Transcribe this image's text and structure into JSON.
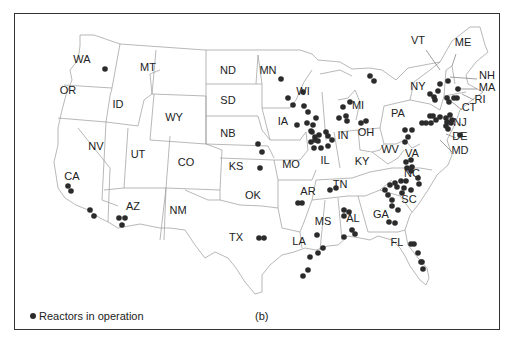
{
  "map": {
    "panel_label": "(b)",
    "legend": {
      "label": "Reactors in operation",
      "marker": "filled-circle",
      "color": "#2b2b2b"
    },
    "states": [
      {
        "code": "WA",
        "x": 82,
        "y": 63
      },
      {
        "code": "OR",
        "x": 68,
        "y": 94
      },
      {
        "code": "ID",
        "x": 118,
        "y": 108
      },
      {
        "code": "MT",
        "x": 148,
        "y": 71
      },
      {
        "code": "WY",
        "x": 174,
        "y": 121
      },
      {
        "code": "ND",
        "x": 228,
        "y": 74
      },
      {
        "code": "SD",
        "x": 228,
        "y": 104
      },
      {
        "code": "NB",
        "x": 228,
        "y": 137
      },
      {
        "code": "KS",
        "x": 236,
        "y": 170
      },
      {
        "code": "NV",
        "x": 96,
        "y": 150
      },
      {
        "code": "UT",
        "x": 138,
        "y": 158
      },
      {
        "code": "CO",
        "x": 186,
        "y": 166
      },
      {
        "code": "CA",
        "x": 72,
        "y": 180
      },
      {
        "code": "AZ",
        "x": 133,
        "y": 210
      },
      {
        "code": "NM",
        "x": 178,
        "y": 214
      },
      {
        "code": "OK",
        "x": 253,
        "y": 199
      },
      {
        "code": "TX",
        "x": 236,
        "y": 241
      },
      {
        "code": "MN",
        "x": 268,
        "y": 74
      },
      {
        "code": "IA",
        "x": 283,
        "y": 125
      },
      {
        "code": "MO",
        "x": 291,
        "y": 168
      },
      {
        "code": "AR",
        "x": 308,
        "y": 195
      },
      {
        "code": "LA",
        "x": 299,
        "y": 245
      },
      {
        "code": "WI",
        "x": 303,
        "y": 95
      },
      {
        "code": "IL",
        "x": 325,
        "y": 164
      },
      {
        "code": "IN",
        "x": 343,
        "y": 139
      },
      {
        "code": "MI",
        "x": 358,
        "y": 109
      },
      {
        "code": "OH",
        "x": 366,
        "y": 136
      },
      {
        "code": "KY",
        "x": 362,
        "y": 165
      },
      {
        "code": "TN",
        "x": 340,
        "y": 188
      },
      {
        "code": "MS",
        "x": 323,
        "y": 225
      },
      {
        "code": "AL",
        "x": 353,
        "y": 222
      },
      {
        "code": "GA",
        "x": 381,
        "y": 218
      },
      {
        "code": "FL",
        "x": 397,
        "y": 246
      },
      {
        "code": "SC",
        "x": 409,
        "y": 203
      },
      {
        "code": "NC",
        "x": 412,
        "y": 177
      },
      {
        "code": "WV",
        "x": 390,
        "y": 153
      },
      {
        "code": "VA",
        "x": 412,
        "y": 157
      },
      {
        "code": "PA",
        "x": 398,
        "y": 117
      },
      {
        "code": "NY",
        "x": 418,
        "y": 90
      },
      {
        "code": "VT",
        "x": 418,
        "y": 44
      },
      {
        "code": "ME",
        "x": 463,
        "y": 46
      },
      {
        "code": "NH",
        "x": 487,
        "y": 79
      },
      {
        "code": "MA",
        "x": 487,
        "y": 91
      },
      {
        "code": "RI",
        "x": 480,
        "y": 103
      },
      {
        "code": "CT",
        "x": 469,
        "y": 111
      },
      {
        "code": "NJ",
        "x": 460,
        "y": 126
      },
      {
        "code": "DE",
        "x": 460,
        "y": 140
      },
      {
        "code": "MD",
        "x": 460,
        "y": 154
      }
    ],
    "reactors_approx_px": [
      [
        105,
        69
      ],
      [
        68,
        186
      ],
      [
        71,
        191
      ],
      [
        90,
        210
      ],
      [
        94,
        216
      ],
      [
        119,
        218
      ],
      [
        125,
        218
      ],
      [
        122,
        225
      ],
      [
        259,
        238
      ],
      [
        264,
        238
      ],
      [
        258,
        144
      ],
      [
        262,
        152
      ],
      [
        260,
        168
      ],
      [
        281,
        79
      ],
      [
        288,
        98
      ],
      [
        293,
        105
      ],
      [
        297,
        125
      ],
      [
        303,
        92
      ],
      [
        304,
        106
      ],
      [
        308,
        112
      ],
      [
        307,
        123
      ],
      [
        311,
        131
      ],
      [
        315,
        137
      ],
      [
        316,
        118
      ],
      [
        313,
        125
      ],
      [
        312,
        132
      ],
      [
        315,
        140
      ],
      [
        311,
        142
      ],
      [
        314,
        148
      ],
      [
        318,
        141
      ],
      [
        319,
        135
      ],
      [
        326,
        132
      ],
      [
        328,
        136
      ],
      [
        321,
        148
      ],
      [
        328,
        146
      ],
      [
        332,
        140
      ],
      [
        302,
        203
      ],
      [
        298,
        203
      ],
      [
        330,
        190
      ],
      [
        336,
        188
      ],
      [
        344,
        210
      ],
      [
        349,
        212
      ],
      [
        344,
        216
      ],
      [
        352,
        230
      ],
      [
        355,
        234
      ],
      [
        344,
        237
      ],
      [
        317,
        235
      ],
      [
        323,
        248
      ],
      [
        310,
        257
      ],
      [
        318,
        253
      ],
      [
        303,
        276
      ],
      [
        308,
        270
      ],
      [
        397,
        187
      ],
      [
        404,
        188
      ],
      [
        385,
        190
      ],
      [
        390,
        185
      ],
      [
        395,
        183
      ],
      [
        388,
        195
      ],
      [
        392,
        200
      ],
      [
        392,
        206
      ],
      [
        398,
        210
      ],
      [
        389,
        222
      ],
      [
        395,
        223
      ],
      [
        402,
        193
      ],
      [
        411,
        190
      ],
      [
        419,
        184
      ],
      [
        418,
        178
      ],
      [
        411,
        171
      ],
      [
        401,
        181
      ],
      [
        406,
        181
      ],
      [
        406,
        162
      ],
      [
        411,
        160
      ],
      [
        407,
        168
      ],
      [
        412,
        167
      ],
      [
        405,
        142
      ],
      [
        408,
        137
      ],
      [
        405,
        130
      ],
      [
        412,
        130
      ],
      [
        430,
        94
      ],
      [
        434,
        97
      ],
      [
        435,
        100
      ],
      [
        438,
        91
      ],
      [
        447,
        98
      ],
      [
        449,
        102
      ],
      [
        454,
        98
      ],
      [
        457,
        98
      ],
      [
        458,
        89
      ],
      [
        448,
        81
      ],
      [
        440,
        84
      ],
      [
        460,
        135
      ],
      [
        422,
        123
      ],
      [
        426,
        123
      ],
      [
        431,
        123
      ],
      [
        430,
        116
      ],
      [
        433,
        116
      ],
      [
        436,
        120
      ],
      [
        440,
        117
      ],
      [
        446,
        118
      ],
      [
        450,
        115
      ],
      [
        452,
        120
      ],
      [
        451,
        123
      ],
      [
        447,
        122
      ],
      [
        446,
        126
      ],
      [
        448,
        129
      ],
      [
        343,
        107
      ],
      [
        346,
        116
      ],
      [
        347,
        121
      ],
      [
        339,
        118
      ],
      [
        361,
        123
      ],
      [
        366,
        121
      ],
      [
        350,
        102
      ],
      [
        370,
        76
      ],
      [
        374,
        81
      ],
      [
        411,
        244
      ],
      [
        414,
        244
      ],
      [
        418,
        253
      ],
      [
        421,
        262
      ],
      [
        422,
        262
      ],
      [
        423,
        269
      ]
    ]
  }
}
